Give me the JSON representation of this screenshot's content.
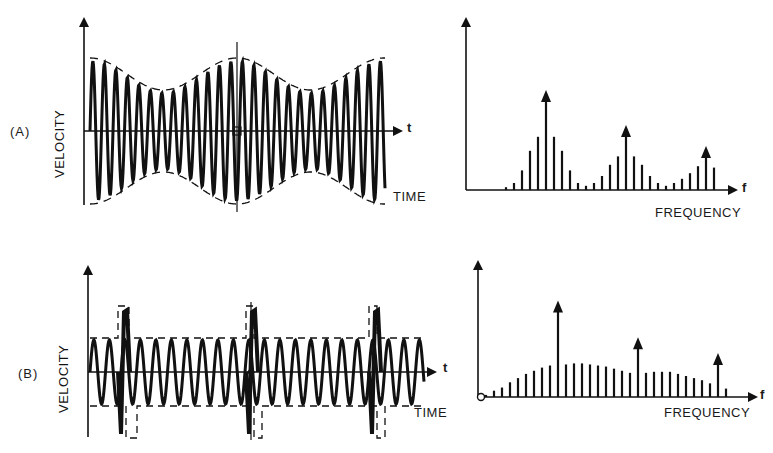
{
  "figure": {
    "panels": [
      {
        "id": "A",
        "label": "(A)",
        "time_plot": {
          "y_axis_label": "VELOCITY",
          "x_axis_label": "TIME",
          "x_axis_var": "t",
          "signal": "amplitude-modulated sinusoid (beating)",
          "envelope_style": "dashed"
        },
        "spectrum": {
          "x_axis_label": "FREQUENCY",
          "x_axis_var": "f",
          "peak_style": "arrow"
        }
      },
      {
        "id": "B",
        "label": "(B)",
        "time_plot": {
          "y_axis_label": "VELOCITY",
          "x_axis_label": "TIME",
          "x_axis_var": "t",
          "signal": "sinusoid with periodic impulses",
          "envelope_style": "dashed pulse train"
        },
        "spectrum": {
          "x_axis_label": "FREQUENCY",
          "x_axis_var": "f",
          "peak_style": "arrow"
        }
      }
    ]
  },
  "chart_data": [
    {
      "type": "bar",
      "title": "(A) spectrum",
      "xlabel": "FREQUENCY",
      "ylabel": "",
      "description": "Discrete spectral lines: three carrier peaks (arrows) each surrounded by sidebands",
      "lines": [
        {
          "x": 40,
          "h": 2
        },
        {
          "x": 48,
          "h": 5
        },
        {
          "x": 56,
          "h": 14
        },
        {
          "x": 64,
          "h": 28
        },
        {
          "x": 72,
          "h": 38
        },
        {
          "x": 80,
          "h": 70,
          "arrow": true
        },
        {
          "x": 88,
          "h": 38
        },
        {
          "x": 96,
          "h": 28
        },
        {
          "x": 104,
          "h": 14
        },
        {
          "x": 112,
          "h": 5
        },
        {
          "x": 120,
          "h": 3
        },
        {
          "x": 128,
          "h": 5
        },
        {
          "x": 136,
          "h": 10
        },
        {
          "x": 144,
          "h": 18
        },
        {
          "x": 152,
          "h": 24
        },
        {
          "x": 160,
          "h": 45,
          "arrow": true
        },
        {
          "x": 168,
          "h": 24
        },
        {
          "x": 176,
          "h": 18
        },
        {
          "x": 184,
          "h": 10
        },
        {
          "x": 192,
          "h": 5
        },
        {
          "x": 200,
          "h": 3
        },
        {
          "x": 208,
          "h": 5
        },
        {
          "x": 216,
          "h": 8
        },
        {
          "x": 224,
          "h": 12
        },
        {
          "x": 232,
          "h": 17
        },
        {
          "x": 240,
          "h": 30,
          "arrow": true
        },
        {
          "x": 248,
          "h": 16
        }
      ]
    },
    {
      "type": "bar",
      "title": "(B) spectrum",
      "xlabel": "FREQUENCY",
      "ylabel": "",
      "description": "Broad hump of harmonic lines from the impulse train, plus three arrowed peaks",
      "lines": [
        {
          "x": 8,
          "h": 2
        },
        {
          "x": 16,
          "h": 6
        },
        {
          "x": 24,
          "h": 9
        },
        {
          "x": 32,
          "h": 14
        },
        {
          "x": 40,
          "h": 18
        },
        {
          "x": 48,
          "h": 22
        },
        {
          "x": 56,
          "h": 25
        },
        {
          "x": 64,
          "h": 28
        },
        {
          "x": 72,
          "h": 30
        },
        {
          "x": 80,
          "h": 90,
          "arrow": true
        },
        {
          "x": 88,
          "h": 31
        },
        {
          "x": 96,
          "h": 32
        },
        {
          "x": 104,
          "h": 32
        },
        {
          "x": 112,
          "h": 31
        },
        {
          "x": 120,
          "h": 30
        },
        {
          "x": 128,
          "h": 29
        },
        {
          "x": 136,
          "h": 27
        },
        {
          "x": 144,
          "h": 25
        },
        {
          "x": 152,
          "h": 23
        },
        {
          "x": 160,
          "h": 55,
          "arrow": true
        },
        {
          "x": 168,
          "h": 23
        },
        {
          "x": 176,
          "h": 24
        },
        {
          "x": 184,
          "h": 24
        },
        {
          "x": 192,
          "h": 24
        },
        {
          "x": 200,
          "h": 22
        },
        {
          "x": 208,
          "h": 20
        },
        {
          "x": 216,
          "h": 18
        },
        {
          "x": 224,
          "h": 16
        },
        {
          "x": 232,
          "h": 13
        },
        {
          "x": 240,
          "h": 40,
          "arrow": true
        },
        {
          "x": 248,
          "h": 8
        }
      ]
    }
  ]
}
